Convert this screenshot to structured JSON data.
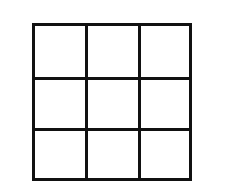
{
  "diagram": {
    "type": "grid",
    "rows": 3,
    "columns": 3,
    "line_color": "#111111",
    "background_color": "#ffffff",
    "cells": [
      [
        "",
        "",
        ""
      ],
      [
        "",
        "",
        ""
      ],
      [
        "",
        "",
        ""
      ]
    ]
  }
}
